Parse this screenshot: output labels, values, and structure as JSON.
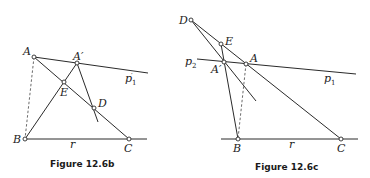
{
  "figures": [
    {
      "id": "fig-12-6b",
      "caption": "Figure 12.6b",
      "points": {
        "A": {
          "label": "A",
          "x": 34,
          "y": 57
        },
        "A_prime": {
          "label": "A′",
          "x": 77,
          "y": 63
        },
        "E": {
          "label": "E",
          "x": 64,
          "y": 82
        },
        "D": {
          "label": "D",
          "x": 94,
          "y": 108
        },
        "B": {
          "label": "B",
          "x": 25,
          "y": 139
        },
        "C": {
          "label": "C",
          "x": 129,
          "y": 139
        }
      },
      "lines": {
        "p1_prime": {
          "label": "p",
          "prime": "′",
          "subscript": "1"
        },
        "r": {
          "label": "r"
        }
      }
    },
    {
      "id": "fig-12-6c",
      "caption": "Figure 12.6c",
      "points": {
        "D": {
          "label": "D",
          "x": 191,
          "y": 20
        },
        "E": {
          "label": "E",
          "x": 221,
          "y": 44
        },
        "A_prime": {
          "label": "A′",
          "x": 224,
          "y": 62
        },
        "A": {
          "label": "A",
          "x": 246,
          "y": 64
        },
        "B": {
          "label": "B",
          "x": 238,
          "y": 139
        },
        "C": {
          "label": "C",
          "x": 341,
          "y": 139
        }
      },
      "lines": {
        "p2": {
          "label": "p",
          "subscript": "2"
        },
        "p1": {
          "label": "p",
          "subscript": "1"
        },
        "r": {
          "label": "r"
        }
      }
    }
  ]
}
